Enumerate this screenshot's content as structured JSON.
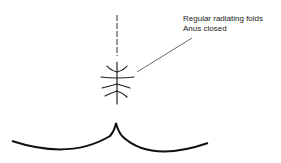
{
  "diagram": {
    "labels": [
      "Regular radiating folds",
      "Anus closed"
    ]
  }
}
